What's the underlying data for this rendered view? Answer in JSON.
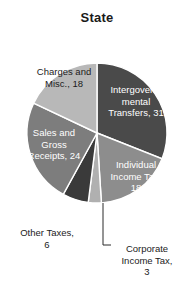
{
  "chart_data": {
    "type": "pie",
    "title": "State",
    "xlabel": "",
    "ylabel": "",
    "legend": "none",
    "grid": false,
    "units": "percent",
    "start_angle_deg": 0,
    "direction": "clockwise",
    "categories": [
      "Intergovernmental Transfers",
      "Individual Income Tax",
      "Corporate Income Tax",
      "Other Taxes",
      "Sales and Gross Receipts",
      "Charges and Misc."
    ],
    "values": [
      31,
      18,
      3,
      6,
      24,
      18
    ],
    "slices": [
      {
        "name": "Intergovernmental Transfers",
        "value": 31,
        "label": "Intergovern-\nmental\nTransfers, 31",
        "label_line1": "Intergovern-",
        "label_line2": "mental",
        "label_line3": "Transfers, 31",
        "color": "#4a4a4a",
        "text_color": "#ffffff",
        "label_placement": "inside"
      },
      {
        "name": "Individual Income Tax",
        "value": 18,
        "label": "Individual\nIncome Tax,\n18",
        "label_line1": "Individual",
        "label_line2": "Income Tax,",
        "label_line3": "18",
        "color": "#8d8d8d",
        "text_color": "#ffffff",
        "label_placement": "inside"
      },
      {
        "name": "Corporate Income Tax",
        "value": 3,
        "label": "Corporate\nIncome Tax,\n3",
        "label_line1": "Corporate",
        "label_line2": "Income Tax,",
        "label_line3": "3",
        "color": "#b0b0b0",
        "text_color": "#1b1b1b",
        "label_placement": "outside-leader"
      },
      {
        "name": "Other Taxes",
        "value": 6,
        "label": "Other Taxes,\n6",
        "label_line1": "Other Taxes,",
        "label_line2": "6",
        "color": "#3a3a3a",
        "text_color": "#1b1b1b",
        "label_placement": "outside"
      },
      {
        "name": "Sales and Gross Receipts",
        "value": 24,
        "label": "Sales and\nGross\nReceipts, 24",
        "label_line1": "Sales and",
        "label_line2": "Gross",
        "label_line3": "Receipts, 24",
        "color": "#7d7d7d",
        "text_color": "#ffffff",
        "label_placement": "inside"
      },
      {
        "name": "Charges and Misc.",
        "value": 18,
        "label": "Charges and\nMisc., 18",
        "label_line1": "Charges and",
        "label_line2": "Misc., 18",
        "color": "#b8b8b8",
        "text_color": "#1b1b1b",
        "label_placement": "inside"
      }
    ],
    "colors": {
      "background": "#ffffff",
      "title_color": "#1a1a1a",
      "slice_separator": "#ffffff",
      "leader_line": "#2b2b2b"
    }
  }
}
